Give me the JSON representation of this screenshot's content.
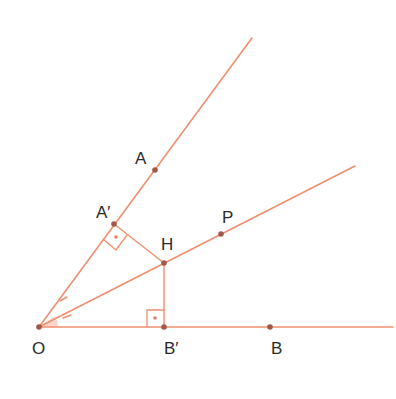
{
  "diagram": {
    "colors": {
      "line": "#ef8f6f",
      "point": "#a0584a",
      "label": "#2b2b2b"
    },
    "points": {
      "O": {
        "label": "O"
      },
      "A": {
        "label": "A"
      },
      "A_prime": {
        "label": "A′"
      },
      "H": {
        "label": "H"
      },
      "P": {
        "label": "P"
      },
      "B_prime": {
        "label": "B′"
      },
      "B": {
        "label": "B"
      }
    },
    "rays": [
      "OA",
      "OP",
      "OB"
    ],
    "segments": [
      "HA′",
      "HB′"
    ],
    "right_angles": [
      "at A′ between OA and HA′",
      "at B′ between OB and HB′"
    ],
    "equal_angle_marks": [
      "AOP",
      "POB"
    ]
  }
}
